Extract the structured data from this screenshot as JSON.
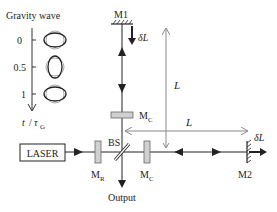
{
  "diagram": {
    "title": "Gravity wave",
    "time_axis": {
      "label_t": "t",
      "label_sep": "/",
      "label_tau": "τ",
      "label_sub": "G",
      "ticks": [
        "0",
        "0.5",
        "1"
      ]
    },
    "components": {
      "laser": "LASER",
      "m1": "M1",
      "m2": "M2",
      "mr_main": "M",
      "mr_sub": "R",
      "mc_main": "M",
      "mc_sub": "C",
      "bs": "BS",
      "output": "Output"
    },
    "dimensions": {
      "arm_length": "L",
      "delta_l": "δL"
    },
    "colors": {
      "beam": "#222222",
      "mirror_fill": "#d0d0d0",
      "dimension_line": "#888888"
    }
  }
}
